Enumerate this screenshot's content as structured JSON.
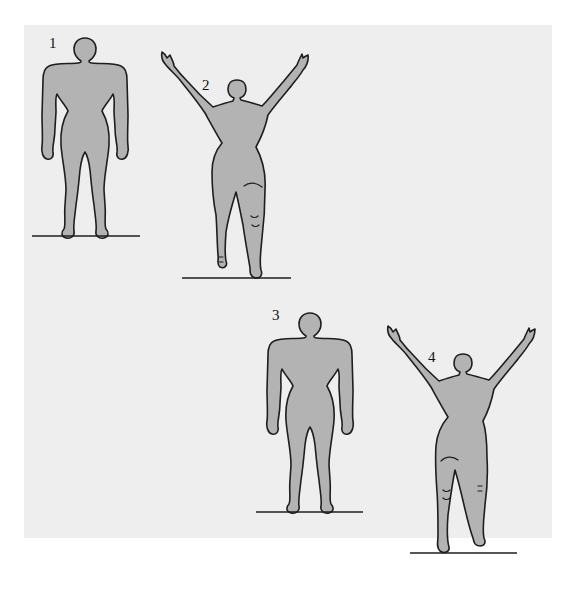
{
  "diagram": {
    "title": "",
    "colors": {
      "page_background": "#ffffff",
      "panel_background": "#eeeeee",
      "figure_fill": "#b3b3b3",
      "outline": "#1e1e1e"
    },
    "figures": [
      {
        "label": "1",
        "pose": "standing, arms at sides, back view"
      },
      {
        "label": "2",
        "pose": "arms raised overhead, one foot lifted, back view"
      },
      {
        "label": "3",
        "pose": "standing, arms at sides, back view"
      },
      {
        "label": "4",
        "pose": "arms raised overhead, one foot lifted, back view"
      }
    ]
  }
}
